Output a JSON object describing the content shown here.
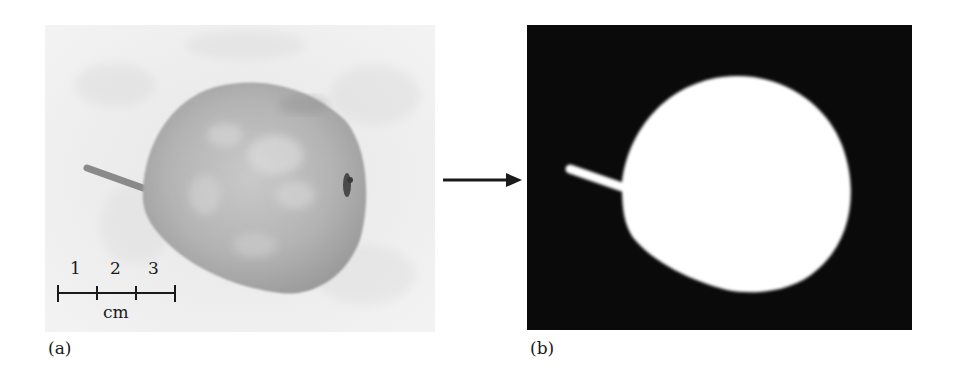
{
  "figure": {
    "panels": [
      {
        "label": "(a)",
        "description": "Grayscale photograph of a pear with stem pointing left",
        "scale_bar": {
          "ticks": [
            "1",
            "2",
            "3"
          ],
          "unit": "cm"
        }
      },
      {
        "label": "(b)",
        "description": "Binary segmentation mask: white pear silhouette on black background"
      }
    ],
    "arrow": "right-arrow"
  }
}
